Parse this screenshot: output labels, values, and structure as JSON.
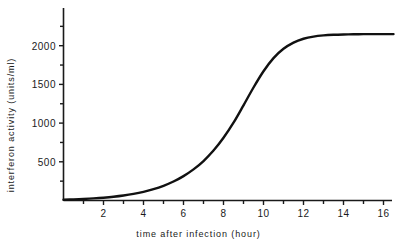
{
  "chart_data": {
    "type": "line",
    "title": "",
    "xlabel": "time after infection (hour)",
    "ylabel": "interferon activity (units/ml)",
    "xlim": [
      0,
      17
    ],
    "ylim": [
      0,
      2400
    ],
    "grid": false,
    "legend": "none",
    "x_ticks": [
      2,
      4,
      6,
      8,
      10,
      12,
      14,
      16
    ],
    "x_tick_labels": [
      "2",
      "4",
      "6",
      "8",
      "10",
      "12",
      "14",
      "16"
    ],
    "x_minor_ticks": [
      1,
      3,
      5,
      7,
      9,
      11,
      13,
      15
    ],
    "y_ticks": [
      500,
      1000,
      1500,
      2000
    ],
    "y_tick_labels": [
      "500",
      "1000",
      "1500",
      "2000"
    ],
    "y_minor_ticks": [
      250,
      750,
      1250,
      1750,
      2250
    ],
    "series": [
      {
        "name": "interferon activity",
        "color": "#111111",
        "x": [
          0,
          0.5,
          1,
          1.5,
          2,
          2.5,
          3,
          3.5,
          4,
          4.5,
          5,
          5.5,
          6,
          6.5,
          7,
          7.5,
          8,
          8.5,
          9,
          9.5,
          10,
          10.5,
          11,
          11.5,
          12,
          12.5,
          13,
          13.5,
          14,
          14.5,
          15,
          15.5,
          16,
          16.5
        ],
        "y": [
          10,
          14,
          20,
          27,
          36,
          48,
          64,
          85,
          112,
          146,
          190,
          245,
          315,
          402,
          510,
          645,
          810,
          1005,
          1230,
          1460,
          1670,
          1840,
          1960,
          2040,
          2090,
          2118,
          2133,
          2141,
          2145,
          2147,
          2149,
          2150,
          2150,
          2150
        ]
      }
    ],
    "annotations": [],
    "plateau_value": 2150,
    "midpoint_time": 9.6
  },
  "axes": {
    "y_title": "interferon activity (units/ml)",
    "x_title": "time after infection (hour)"
  },
  "style": {
    "curve_color": "#111111",
    "axis_color": "#1a1a1a",
    "background": "#ffffff"
  }
}
